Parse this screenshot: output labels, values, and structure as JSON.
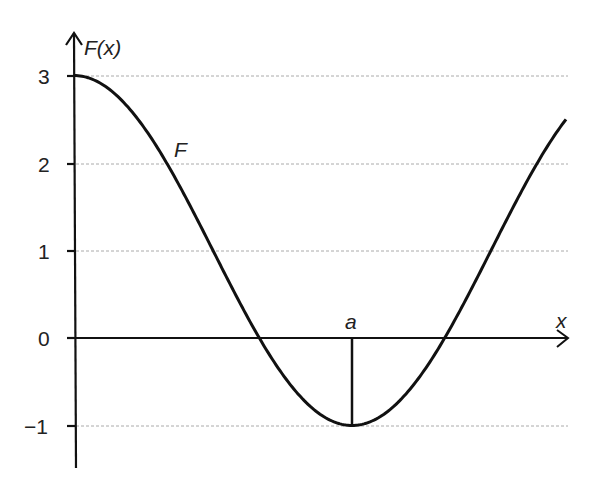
{
  "chart_data": {
    "type": "line",
    "title": "",
    "xlabel": "x",
    "ylabel": "F(x)",
    "curve_label": "F",
    "marked_point": {
      "label": "a",
      "x_fraction": 1.0,
      "y": -1
    },
    "yticks": [
      3,
      2,
      1,
      0,
      -1
    ],
    "ytick_labels": [
      "3",
      "2",
      "1",
      "0",
      "−1"
    ],
    "ylim": [
      -1.5,
      3.5
    ],
    "grid": "horizontal dotted at y = 3, 2, 1, -1",
    "series": [
      {
        "name": "F",
        "description": "F(x) = 1 + 2cos(πx/a) for x from 0 to ~1.77a",
        "x_in_units_of_a": [
          0,
          0.25,
          0.5,
          0.667,
          0.75,
          1.0,
          1.25,
          1.333,
          1.5,
          1.77
        ],
        "values": [
          3,
          2.41,
          1,
          0,
          -0.41,
          -1,
          -0.41,
          0,
          1,
          2.5
        ]
      }
    ],
    "colors": {
      "curve": "#111111",
      "grid": "#aaaaaa",
      "axis": "#111111"
    }
  },
  "labels": {
    "y_axis": "F(x)",
    "x_axis": "x",
    "curve": "F",
    "point_a": "a",
    "y3": "3",
    "y2": "2",
    "y1": "1",
    "y0": "0",
    "ym1": "−1"
  }
}
